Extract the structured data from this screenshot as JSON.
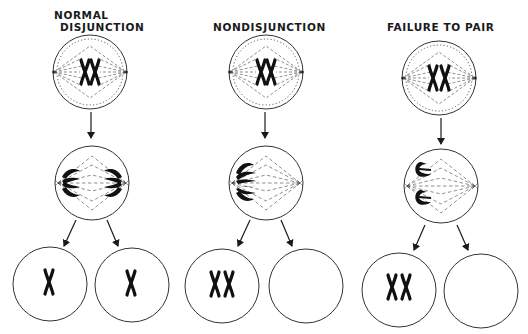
{
  "columns": [
    {
      "title_line1": "NORMAL",
      "title_line2": "DISJUNCTION",
      "stage1": "metaphase with paired homologs",
      "stage2": "anaphase - homologs separate to both poles",
      "daughters": [
        "one chromosome",
        "one chromosome"
      ]
    },
    {
      "title_line1": "NONDISJUNCTION",
      "title_line2": "",
      "stage1": "metaphase with paired homologs",
      "stage2": "anaphase - both homologs go to one pole",
      "daughters": [
        "two chromosomes",
        "no chromosome"
      ]
    },
    {
      "title_line1": "FAILURE TO PAIR",
      "title_line2": "",
      "stage1": "metaphase with unpaired homologs",
      "stage2": "anaphase - unpaired homologs go to one pole",
      "daughters": [
        "two chromosomes",
        "no chromosome"
      ]
    }
  ],
  "colors": {
    "ink": "#1a1a1a",
    "background": "#ffffff"
  }
}
